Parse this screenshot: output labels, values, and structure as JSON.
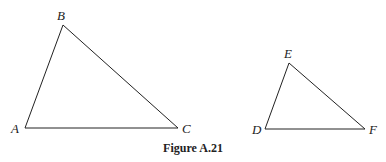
{
  "figure": {
    "caption": "Figure A.21",
    "triangles": [
      {
        "name": "ABC",
        "vertices": [
          {
            "label": "A",
            "x": 25,
            "y": 128,
            "lx": 11,
            "ly": 133
          },
          {
            "label": "B",
            "x": 63,
            "y": 25,
            "lx": 57,
            "ly": 20
          },
          {
            "label": "C",
            "x": 178,
            "y": 128,
            "lx": 182,
            "ly": 133
          }
        ]
      },
      {
        "name": "DEF",
        "vertices": [
          {
            "label": "D",
            "x": 265,
            "y": 129,
            "lx": 252,
            "ly": 134
          },
          {
            "label": "E",
            "x": 289,
            "y": 63,
            "lx": 284,
            "ly": 58
          },
          {
            "label": "F",
            "x": 365,
            "y": 129,
            "lx": 369,
            "ly": 134
          }
        ]
      }
    ],
    "stroke_color": "#222222"
  }
}
